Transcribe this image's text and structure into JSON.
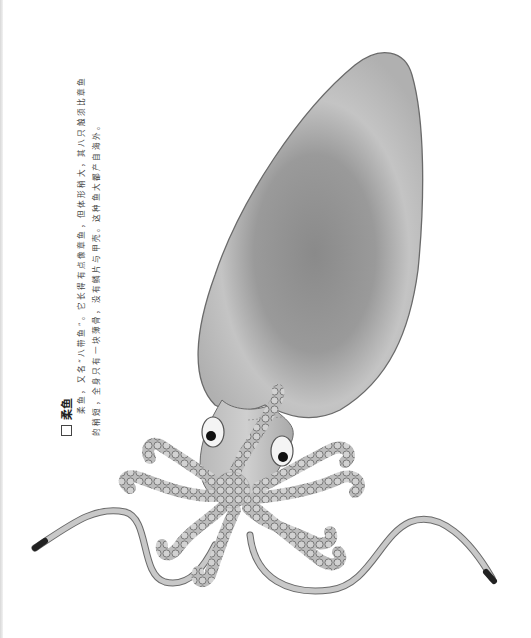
{
  "caption": {
    "title_icon": "square-bullet-icon",
    "title": "柔鱼",
    "lines": [
      "柔鱼，又名“八带鱼”。它长得有点像章鱼，但体形稍大，其八只触须比章鱼",
      "的稍短，全身只有一块薄骨，没有鳞片与甲壳。这种鱼大都产自海外。"
    ]
  },
  "illustration": {
    "subject": "squid-illustration",
    "colors": {
      "mantle_light": "#c9c9c9",
      "mantle_dark": "#8e8e8e",
      "outline": "#6a6a6a",
      "tentacle": "#bdbdbd",
      "sucker": "#a8a8a8",
      "eye": "#111111"
    }
  }
}
